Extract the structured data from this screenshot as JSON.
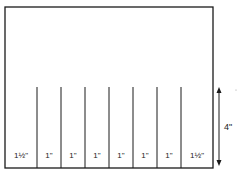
{
  "diagram": {
    "type": "divided-panel",
    "outer_rect": {
      "x": 5,
      "y": 7,
      "width": 208,
      "height": 161
    },
    "dividers": {
      "x_positions": [
        37,
        61,
        85,
        109,
        133,
        157,
        181
      ],
      "top_y": 87,
      "bottom_y": 168
    },
    "section_labels": [
      {
        "text": "1½\"",
        "cx": 21
      },
      {
        "text": "1\"",
        "cx": 49
      },
      {
        "text": "1\"",
        "cx": 73
      },
      {
        "text": "1\"",
        "cx": 97
      },
      {
        "text": "1\"",
        "cx": 121
      },
      {
        "text": "1\"",
        "cx": 145
      },
      {
        "text": "1\"",
        "cx": 169
      },
      {
        "text": "1½\"",
        "cx": 197
      }
    ],
    "height_dimension": {
      "label": "4\"",
      "x": 219,
      "y_top": 87,
      "y_bottom": 166
    },
    "stroke_color": "#1a1a1a"
  }
}
